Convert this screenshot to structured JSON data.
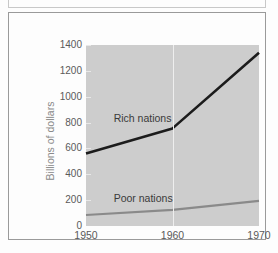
{
  "figure": {
    "background_color": "#fdfdfd",
    "border_color": "#9a9a9a",
    "plot_background_color": "#cdcdcd"
  },
  "chart_data": {
    "type": "line",
    "title": "",
    "subtitle": "",
    "xlabel": "",
    "ylabel": "Billions of dollars",
    "x": [
      1950,
      1960,
      1970
    ],
    "xticks": [
      "1950",
      "1960",
      "1970"
    ],
    "xlim": [
      1950,
      1970
    ],
    "yticks": [
      "0",
      "200",
      "400",
      "600",
      "800",
      "1000",
      "1200",
      "1400"
    ],
    "ylim": [
      0,
      1400
    ],
    "grid": "vertical-only",
    "legend_position": "inline-annotations",
    "series": [
      {
        "name": "Rich nations",
        "values": [
          560,
          755,
          1340
        ],
        "color": "#1c1c1c",
        "width": 2.6,
        "label_x": 1953.2,
        "label_y": 830
      },
      {
        "name": "Poor nations",
        "values": [
          85,
          125,
          195
        ],
        "color": "#8a8a8a",
        "width": 2.2,
        "label_x": 1953.2,
        "label_y": 205
      }
    ]
  }
}
